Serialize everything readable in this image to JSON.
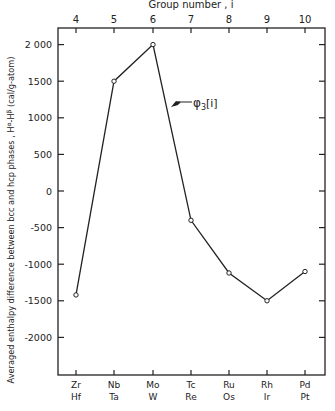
{
  "chart_data": {
    "type": "line",
    "title": "",
    "top_xlabel": "Group number , i",
    "top_ticks": [
      "4",
      "5",
      "6",
      "7",
      "8",
      "9",
      "10"
    ],
    "categories": [
      "Zr/Hf",
      "Nb/Ta",
      "Mo/W",
      "Tc/Re",
      "Ru/Os",
      "Rh/Ir",
      "Pd/Pt"
    ],
    "bottom_labels_row1": [
      "Zr",
      "Nb",
      "Mo",
      "Tc",
      "Ru",
      "Rh",
      "Pd"
    ],
    "bottom_labels_row2": [
      "Hf",
      "Ta",
      "W",
      "Re",
      "Os",
      "Ir",
      "Pt"
    ],
    "ylabel": "Averaged enthalpy difference between bcc and hcp phases , Hᵅ-Hᵝ (cal/g-atom)",
    "yticks": [
      "2 000",
      "1500",
      "1000",
      "500",
      "0",
      "-500",
      "-1000",
      "-1500",
      "-2000"
    ],
    "ylim": [
      -2500,
      2200
    ],
    "series": [
      {
        "name": "φ₃[i]",
        "values": [
          -1420,
          1500,
          2000,
          -400,
          -1120,
          -1500,
          -1100
        ]
      }
    ],
    "annotation": {
      "symbol": "φ",
      "sub": "3",
      "text": "[i]"
    },
    "grid": false
  }
}
